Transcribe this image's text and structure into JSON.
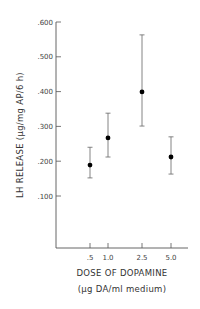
{
  "chart_data": {
    "type": "scatter",
    "title": "",
    "xlabel": "DOSE OF DOPAMINE",
    "xlabel_units": "(µg DA/ml medium)",
    "ylabel": "LH RELEASE  (µg/mg AP/6 h)",
    "categories": [
      ".5",
      "1.0",
      "2.5",
      "5.0"
    ],
    "x": [
      0.5,
      1.0,
      2.5,
      5.0
    ],
    "values": [
      0.189,
      0.267,
      0.399,
      0.212
    ],
    "error_upper": [
      0.24,
      0.338,
      0.563,
      0.27
    ],
    "error_lower": [
      0.152,
      0.212,
      0.301,
      0.163
    ],
    "y_ticks": [
      ".100",
      ".200",
      ".300",
      ".400",
      ".500",
      ".600"
    ],
    "y_tick_values": [
      0.1,
      0.2,
      0.3,
      0.4,
      0.5,
      0.6
    ],
    "ylim": [
      0,
      0.6
    ],
    "grid": false,
    "legend": "none",
    "marker_color": "#000000",
    "error_bar_color": "#666666"
  }
}
